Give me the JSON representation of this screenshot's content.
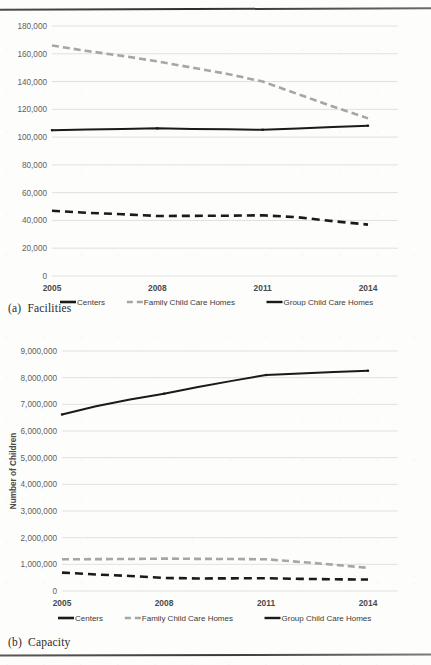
{
  "figure_a": {
    "caption_label": "(a)",
    "caption_text": "Facilities",
    "chart_data": {
      "type": "line",
      "title": "",
      "xlabel": "",
      "ylabel": "",
      "xlim": [
        2005,
        2014
      ],
      "ylim": [
        0,
        180000
      ],
      "ytick_labels": [
        "180,000",
        "160,000",
        "140,000",
        "120,000",
        "100,000",
        "80,000",
        "60,000",
        "40,000",
        "20,000",
        "0"
      ],
      "ytick_values": [
        180000,
        160000,
        140000,
        120000,
        100000,
        80000,
        60000,
        40000,
        20000,
        0
      ],
      "xtick_labels": [
        "2005",
        "2008",
        "2011",
        "2014"
      ],
      "xtick_values": [
        2005,
        2008,
        2011,
        2014
      ],
      "x": [
        2005,
        2006,
        2007,
        2008,
        2009,
        2010,
        2011,
        2012,
        2013,
        2014
      ],
      "grid": "horizontal",
      "legend_position": "bottom",
      "series": [
        {
          "name": "Centers",
          "style": "solid",
          "color": "#1a1a1a",
          "values": [
            105000,
            105400,
            105800,
            106300,
            105900,
            105600,
            105300,
            106200,
            107200,
            108200
          ]
        },
        {
          "name": "Family Child Care Homes",
          "style": "dashed",
          "color": "#a6a6a6",
          "values": [
            166000,
            162000,
            158500,
            154500,
            150000,
            145500,
            140000,
            131000,
            122000,
            113500
          ]
        },
        {
          "name": "Group Child Care Homes",
          "style": "dashed",
          "color": "#1a1a1a",
          "values": [
            47000,
            45500,
            44500,
            43200,
            43300,
            43400,
            43700,
            42300,
            39500,
            37000
          ]
        }
      ]
    }
  },
  "figure_b": {
    "caption_label": "(b)",
    "caption_text": "Capacity",
    "chart_data": {
      "type": "line",
      "title": "",
      "xlabel": "",
      "ylabel": "Number of Children",
      "xlim": [
        2005,
        2014
      ],
      "ylim": [
        0,
        9000000
      ],
      "ytick_labels": [
        "9,000,000",
        "8,000,000",
        "7,000,000",
        "6,000,000",
        "5,000,000",
        "4,000,000",
        "3,000,000",
        "2,000,000",
        "1,000,000",
        "0"
      ],
      "ytick_values": [
        9000000,
        8000000,
        7000000,
        6000000,
        5000000,
        4000000,
        3000000,
        2000000,
        1000000,
        0
      ],
      "xtick_labels": [
        "2005",
        "2008",
        "2011",
        "2014"
      ],
      "xtick_values": [
        2005,
        2008,
        2011,
        2014
      ],
      "x": [
        2005,
        2006,
        2007,
        2008,
        2009,
        2010,
        2011,
        2012,
        2013,
        2014
      ],
      "grid": "horizontal",
      "legend_position": "bottom",
      "series": [
        {
          "name": "Centers",
          "style": "solid",
          "color": "#1a1a1a",
          "values": [
            6620000,
            6930000,
            7180000,
            7400000,
            7650000,
            7880000,
            8100000,
            8160000,
            8210000,
            8260000
          ]
        },
        {
          "name": "Family Child Care Homes",
          "style": "dashed",
          "color": "#a6a6a6",
          "values": [
            1190000,
            1195000,
            1200000,
            1215000,
            1205000,
            1200000,
            1190000,
            1090000,
            985000,
            870000
          ]
        },
        {
          "name": "Group Child Care Homes",
          "style": "dashed",
          "color": "#1a1a1a",
          "values": [
            690000,
            620000,
            565000,
            490000,
            470000,
            475000,
            480000,
            455000,
            440000,
            430000
          ]
        }
      ]
    }
  },
  "legend": {
    "items": [
      {
        "label": "Centers",
        "style": "solid",
        "color": "#1a1a1a"
      },
      {
        "label": "Family Child Care Homes",
        "style": "dashed",
        "color": "#a6a6a6"
      },
      {
        "label": "Group Child Care Homes",
        "style": "dashed",
        "color": "#1a1a1a"
      }
    ]
  },
  "colors": {
    "solid_black": "#1a1a1a",
    "dashed_gray": "#a6a6a6",
    "gridline": "#d9d9d9",
    "tick_text": "#5f5f5f",
    "rule": "#3a3a3a"
  }
}
